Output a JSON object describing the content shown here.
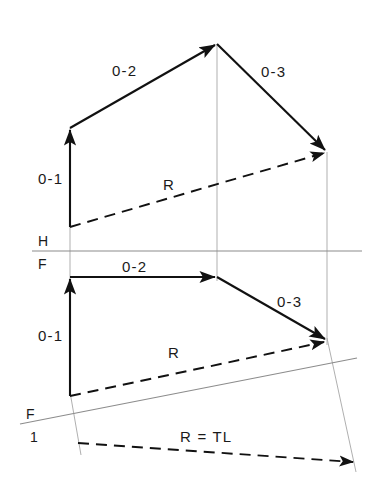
{
  "figure": {
    "background_color": "#ffffff",
    "ink_color": "#111111",
    "thin_line_color": "#9a9a9a",
    "width": 380,
    "height": 483
  },
  "labels": {
    "top_view": {
      "vector_01": "0-1",
      "vector_02": "0-2",
      "vector_03": "0-3",
      "resultant": "R"
    },
    "front_view": {
      "vector_01": "0-1",
      "vector_02": "0-2",
      "vector_03": "0-3",
      "resultant": "R"
    },
    "auxiliary_view": {
      "resultant_true_length": "R = TL"
    },
    "fold_lines": {
      "hf_top": "H",
      "hf_bottom": "F",
      "f1_top": "F",
      "f1_bottom": "1"
    }
  },
  "geometry": {
    "top_view": {
      "origin": [
        70,
        227
      ],
      "p1": [
        70,
        128
      ],
      "p2": [
        217,
        44
      ],
      "p3": [
        327,
        152
      ],
      "resultant_from": [
        70,
        227
      ],
      "resultant_to": [
        327,
        152
      ]
    },
    "front_view": {
      "origin": [
        70,
        396
      ],
      "p1": [
        70,
        277
      ],
      "p2": [
        217,
        277
      ],
      "p3": [
        327,
        341
      ],
      "resultant_from": [
        70,
        396
      ],
      "resultant_to": [
        327,
        341
      ]
    },
    "auxiliary_view": {
      "resultant_from": [
        78,
        443
      ],
      "resultant_to": [
        356,
        463
      ]
    },
    "fold_line_hf": {
      "x1": 32,
      "y1": 251,
      "x2": 362,
      "y2": 251
    },
    "fold_line_f1": {
      "x1": 20,
      "y1": 424,
      "x2": 357,
      "y2": 358
    },
    "projectors": [
      {
        "x1": 70,
        "y1": 128,
        "x2": 70,
        "y2": 290
      },
      {
        "x1": 217,
        "y1": 44,
        "x2": 217,
        "y2": 280
      },
      {
        "x1": 327,
        "y1": 152,
        "x2": 327,
        "y2": 344
      },
      {
        "x1": 70,
        "y1": 394,
        "x2": 80,
        "y2": 452
      },
      {
        "x1": 327,
        "y1": 340,
        "x2": 355,
        "y2": 470
      }
    ]
  },
  "label_positions": {
    "top_01": [
      38,
      184
    ],
    "top_02": [
      112,
      76
    ],
    "top_03": [
      261,
      77
    ],
    "top_R": [
      163,
      190
    ],
    "front_01": [
      38,
      341
    ],
    "front_02": [
      122,
      272
    ],
    "front_03": [
      277,
      307
    ],
    "front_R": [
      168,
      358
    ],
    "aux_RTL": [
      180,
      442
    ],
    "hf_H": [
      38,
      245
    ],
    "hf_F": [
      38,
      269
    ],
    "f1_F": [
      27,
      418
    ],
    "f1_1": [
      30,
      441
    ]
  }
}
